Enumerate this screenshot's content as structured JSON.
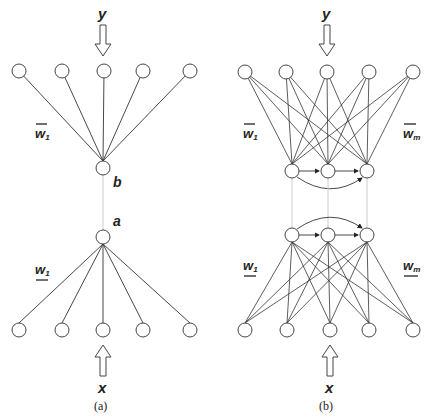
{
  "panels": [
    {
      "id": "a",
      "caption": "(a)",
      "output_label": "y",
      "input_label": "x",
      "top_weight_label": "w",
      "top_weight_sub": "1",
      "bottom_weight_label": "w",
      "bottom_weight_sub": "1",
      "hidden_top_label": "b",
      "hidden_bottom_label": "a",
      "output_nodes": 5,
      "input_nodes": 5,
      "hidden_nodes": 1
    },
    {
      "id": "b",
      "caption": "(b)",
      "output_label": "y",
      "input_label": "x",
      "top_weight_left_label": "w",
      "top_weight_left_sub": "1",
      "top_weight_right_label": "w",
      "top_weight_right_sub": "m",
      "bottom_weight_left_label": "w",
      "bottom_weight_left_sub": "1",
      "bottom_weight_right_label": "w",
      "bottom_weight_right_sub": "m",
      "output_nodes": 5,
      "input_nodes": 5,
      "hidden_nodes": 3
    }
  ],
  "colors": {
    "line": "#333333",
    "node_fill": "#ffffff",
    "dotted": "#cccccc"
  }
}
